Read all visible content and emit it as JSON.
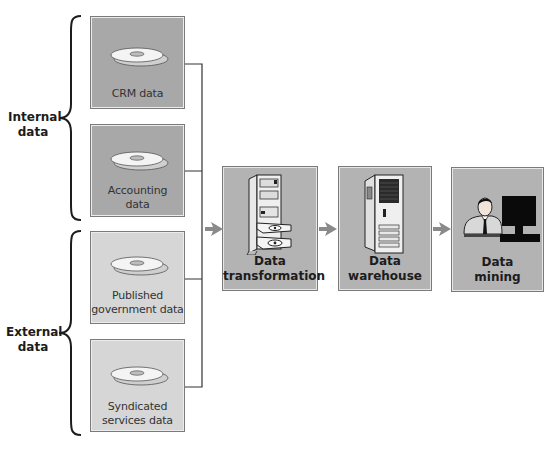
{
  "groups": {
    "internal": {
      "label_line1": "Internal",
      "label_line2": "data"
    },
    "external": {
      "label_line1": "External",
      "label_line2": "data"
    }
  },
  "sources": [
    {
      "id": "crm",
      "group": "internal",
      "line1": "CRM data",
      "line2": "",
      "icon": "disc-stack-icon"
    },
    {
      "id": "accounting",
      "group": "internal",
      "line1": "Accounting",
      "line2": "data",
      "icon": "disc-stack-icon"
    },
    {
      "id": "published",
      "group": "external",
      "line1": "Published",
      "line2": "government data",
      "icon": "disc-stack-icon"
    },
    {
      "id": "syndicated",
      "group": "external",
      "line1": "Syndicated",
      "line2": "services data",
      "icon": "disc-stack-icon"
    }
  ],
  "stages": [
    {
      "id": "transformation",
      "line1": "Data",
      "line2": "transformation",
      "icon": "server-with-disc-drives-icon"
    },
    {
      "id": "warehouse",
      "line1": "Data",
      "line2": "warehouse",
      "icon": "server-tower-icon"
    },
    {
      "id": "mining",
      "line1": "Data",
      "line2": "mining",
      "icon": "person-at-computer-icon"
    }
  ],
  "colors": {
    "internal_box": "#a8a8a8",
    "external_box": "#d6d6d6",
    "stage_box": "#b3b3b3",
    "arrow": "#8a8a8a",
    "line": "#333333"
  }
}
